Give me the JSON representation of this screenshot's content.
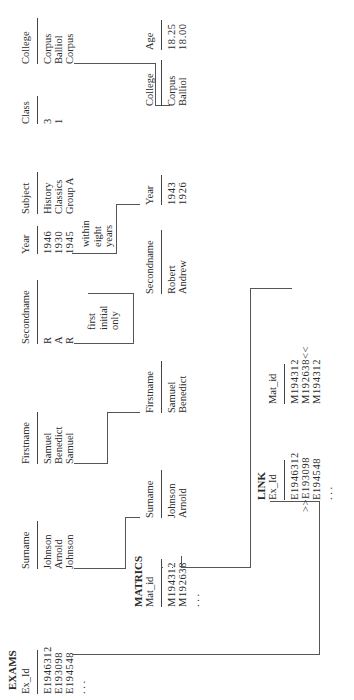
{
  "exams": {
    "title": "EXAMS",
    "columns": [
      {
        "header": "Ex_Id",
        "values": [
          "E1946312",
          "E193098",
          "E194548"
        ]
      },
      {
        "header": "Surname",
        "values": [
          "Johnson",
          "Arnold",
          "Johnson"
        ]
      },
      {
        "header": "Firstname",
        "values": [
          "Samuel",
          "Benedict",
          "Samuel"
        ]
      },
      {
        "header": "Secondname",
        "values": [
          "R",
          "A",
          "R"
        ]
      },
      {
        "header": "Year",
        "values": [
          "1946",
          "1930",
          "1945"
        ]
      },
      {
        "header": "Subject",
        "values": [
          "History",
          "Classics",
          "Group A"
        ]
      },
      {
        "header": "Class",
        "values": [
          "3",
          "1",
          ""
        ]
      },
      {
        "header": "College",
        "values": [
          "Corpus",
          "Balliol",
          "Corpus"
        ]
      }
    ],
    "ellipsis": ". . ."
  },
  "matrics": {
    "title": "MATRICS",
    "columns": [
      {
        "header": "Mat_id",
        "values": [
          "M194312",
          "M192638"
        ]
      },
      {
        "header": "Surname",
        "values": [
          "Johnson",
          "Arnold"
        ]
      },
      {
        "header": "Firstname",
        "values": [
          "Samuel",
          "Benedict"
        ]
      },
      {
        "header": "Secondname",
        "values": [
          "Robert",
          "Andrew"
        ]
      },
      {
        "header": "Year",
        "values": [
          "1943",
          "1926"
        ]
      },
      {
        "header": "College",
        "values": [
          "Corpus",
          "Balliol"
        ]
      },
      {
        "header": "Age",
        "values": [
          "18.25",
          "18.00"
        ]
      }
    ],
    "ellipsis": ". . ."
  },
  "link": {
    "title": "LINK",
    "columns": [
      {
        "header": "Ex_Id",
        "values": [
          "E1946312",
          ">>E193098",
          "E194548"
        ]
      },
      {
        "header": "Mat_id",
        "values": [
          "M194312",
          "M192638<<",
          "M194312"
        ]
      }
    ],
    "ellipsis": ". . ."
  },
  "notes": {
    "secondname": [
      "first",
      "initial",
      "only"
    ],
    "year": [
      "within",
      "eight",
      "years"
    ]
  }
}
